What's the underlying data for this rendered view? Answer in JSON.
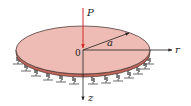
{
  "figure": {
    "labels": {
      "load": "P",
      "origin": "0",
      "radius": "a",
      "radial_axis": "r",
      "vertical_axis": "z"
    },
    "colors": {
      "plate_top": "#eebcb4",
      "plate_edge": "#c0665a",
      "plate_outline": "#3a2a28",
      "load_arrow": "#d42a2a",
      "axis": "#222222",
      "spring": "#444444"
    },
    "spring_count": 14
  }
}
